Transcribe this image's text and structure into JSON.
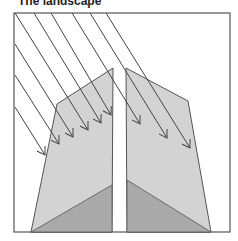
{
  "title": "The landscape",
  "colors": {
    "frame": "#555555",
    "land_light": "#d3d3d3",
    "land_dark": "#a9a9a9",
    "arrow": "#444444",
    "background": "#ffffff"
  },
  "diagram": {
    "frame": {
      "x": 14,
      "y": 13,
      "width": 216,
      "height": 219
    },
    "left_block": {
      "outline": [
        [
          57,
          104
        ],
        [
          113,
          68
        ],
        [
          112,
          232
        ],
        [
          31,
          232
        ]
      ],
      "dark_triangle": [
        [
          31,
          232
        ],
        [
          112,
          185
        ],
        [
          112,
          232
        ]
      ]
    },
    "right_block": {
      "outline": [
        [
          126,
          68
        ],
        [
          188,
          101
        ],
        [
          211,
          232
        ],
        [
          127,
          232
        ]
      ],
      "dark_triangle": [
        [
          127,
          180
        ],
        [
          211,
          232
        ],
        [
          127,
          232
        ]
      ]
    },
    "arrows": [
      {
        "from": [
          15,
          107
        ],
        "to": [
          45,
          155
        ]
      },
      {
        "from": [
          15,
          75
        ],
        "to": [
          59,
          144
        ]
      },
      {
        "from": [
          15,
          44
        ],
        "to": [
          73,
          137
        ]
      },
      {
        "from": [
          15,
          13
        ],
        "to": [
          88,
          130
        ]
      },
      {
        "from": [
          34,
          13
        ],
        "to": [
          101,
          123
        ]
      },
      {
        "from": [
          51,
          13
        ],
        "to": [
          111,
          115
        ]
      },
      {
        "from": [
          72,
          13
        ],
        "to": [
          140,
          124
        ]
      },
      {
        "from": [
          90,
          13
        ],
        "to": [
          167,
          138
        ]
      },
      {
        "from": [
          106,
          13
        ],
        "to": [
          190,
          148
        ]
      }
    ]
  }
}
